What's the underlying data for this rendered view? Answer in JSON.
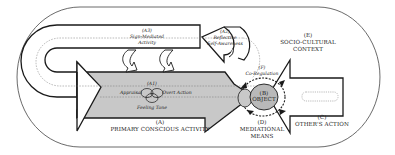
{
  "diagram": {
    "type": "conceptual-model",
    "context": {
      "code": "(E)",
      "label_line1": "SOCIO-CULTURAL",
      "label_line2": "CONTEXT"
    },
    "primary_activity": {
      "code": "(A)",
      "label": "PRIMARY CONSCIOUS ACTIVITY"
    },
    "core": {
      "code": "(A1)",
      "left": "Appraisal",
      "right": "Overt Action",
      "bottom": "Feeling Tone"
    },
    "sign_mediated": {
      "code": "(A3)",
      "line1": "Sign-Mediated",
      "line2": "Activity"
    },
    "reflective": {
      "code": "(A2)",
      "line1": "Reflective",
      "line2": "Self-Awareness"
    },
    "object": {
      "code": "(B)",
      "label": "OBJECT"
    },
    "co_regulation": {
      "code": "(F)",
      "label": "Co-Regulation"
    },
    "mediational": {
      "code": "(D)",
      "line1": "MEDIATIONAL",
      "line2": "MEANS"
    },
    "others_action": {
      "code": "(C)",
      "label": "OTHER'S ACTION"
    },
    "colors": {
      "arrow_fill": "#c8c8c8",
      "object_fill": "#b9b9b9",
      "stroke": "#1a1a1a"
    }
  }
}
